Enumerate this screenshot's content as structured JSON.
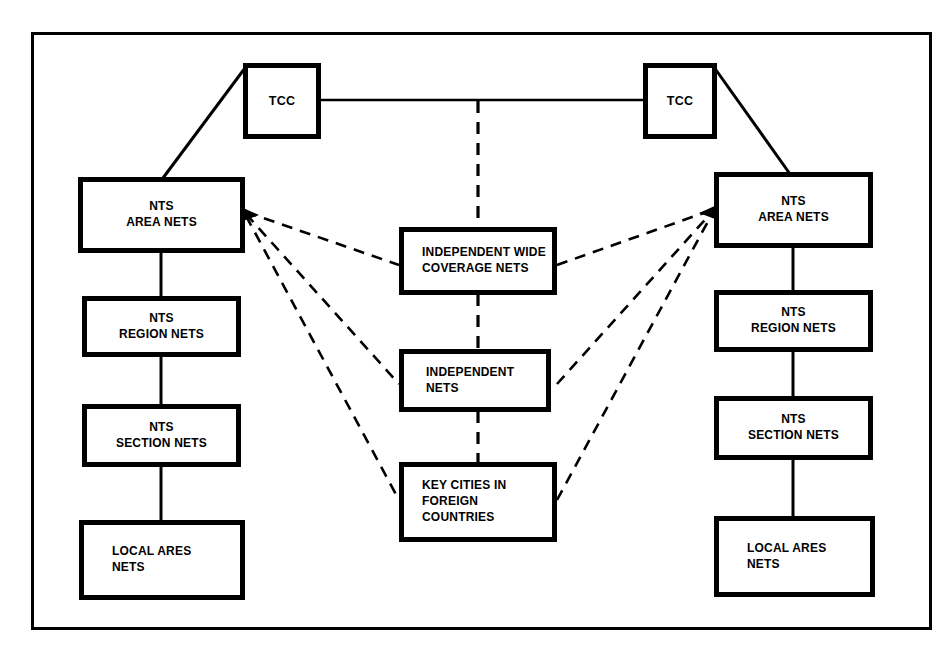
{
  "diagram": {
    "background_color": "#ffffff",
    "line_color": "#000000",
    "frame": {
      "present": true,
      "stroke": "#000000"
    },
    "nodes": {
      "tcc_left": {
        "label": "TCC"
      },
      "tcc_right": {
        "label": "TCC"
      },
      "left_area_nets": {
        "label": "NTS\nAREA NETS"
      },
      "left_region_nets": {
        "label": "NTS\nREGION NETS"
      },
      "left_section_nets": {
        "label": "NTS\nSECTION NETS"
      },
      "left_local_ares_nets": {
        "label": "LOCAL ARES\nNETS"
      },
      "right_area_nets": {
        "label": "NTS\nAREA NETS"
      },
      "right_region_nets": {
        "label": "NTS\nREGION NETS"
      },
      "right_section_nets": {
        "label": "NTS\nSECTION NETS"
      },
      "right_local_ares_nets": {
        "label": "LOCAL ARES\nNETS"
      },
      "independent_wide_coverage_nets": {
        "label": "INDEPENDENT WIDE\nCOVERAGE NETS"
      },
      "independent_nets": {
        "label": "INDEPENDENT NETS"
      },
      "key_cities_foreign": {
        "label": "KEY CITIES IN\nFOREIGN COUNTRIES"
      }
    },
    "edges": [
      {
        "from": "tcc_left",
        "to": "tcc_right",
        "style": "solid"
      },
      {
        "from": "tcc_left",
        "to": "left_area_nets",
        "style": "solid"
      },
      {
        "from": "tcc_right",
        "to": "right_area_nets",
        "style": "solid"
      },
      {
        "from": "left_area_nets",
        "to": "left_region_nets",
        "style": "solid"
      },
      {
        "from": "left_region_nets",
        "to": "left_section_nets",
        "style": "solid"
      },
      {
        "from": "left_section_nets",
        "to": "left_local_ares_nets",
        "style": "solid"
      },
      {
        "from": "right_area_nets",
        "to": "right_region_nets",
        "style": "solid"
      },
      {
        "from": "right_region_nets",
        "to": "right_section_nets",
        "style": "solid"
      },
      {
        "from": "right_section_nets",
        "to": "right_local_ares_nets",
        "style": "solid"
      },
      {
        "from": "tcc_link",
        "to": "independent_wide_coverage_nets",
        "style": "dashed"
      },
      {
        "from": "independent_wide_coverage_nets",
        "to": "independent_nets",
        "style": "dashed"
      },
      {
        "from": "independent_nets",
        "to": "key_cities_foreign",
        "style": "dashed"
      },
      {
        "from": "left_area_nets",
        "to": "independent_wide_coverage_nets",
        "style": "dashed"
      },
      {
        "from": "left_area_nets",
        "to": "independent_nets",
        "style": "dashed"
      },
      {
        "from": "left_area_nets",
        "to": "key_cities_foreign",
        "style": "dashed"
      },
      {
        "from": "right_area_nets",
        "to": "independent_wide_coverage_nets",
        "style": "dashed"
      },
      {
        "from": "right_area_nets",
        "to": "independent_nets",
        "style": "dashed"
      },
      {
        "from": "right_area_nets",
        "to": "key_cities_foreign",
        "style": "dashed"
      }
    ]
  }
}
